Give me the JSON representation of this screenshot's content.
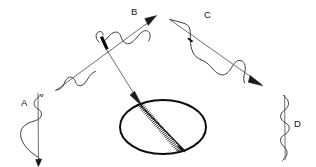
{
  "figure": {
    "title": "",
    "background_color": "#ffffff",
    "ink_color": "#111111",
    "width": 316,
    "height": 167
  },
  "labels": {
    "a": "A",
    "b": "B",
    "c": "C",
    "d": "D"
  },
  "elements": {
    "left_vertical_axis_name": "vertical-axis-left",
    "right_vertical_axis_name": "vertical-axis-right",
    "incoming_ray_name": "incoming-ray-b",
    "outgoing_ray_name": "outgoing-ray-c",
    "scatter_arrow_name": "scatter-arrow",
    "ellipse_name": "scattering-ellipse",
    "coil_name": "helical-coil"
  },
  "geometry": {
    "left_axis": {
      "x": 38,
      "y_top": 94,
      "y_bottom": 165
    },
    "right_axis": {
      "x": 285,
      "y_top": 96,
      "y_bottom": 160
    },
    "ray_b": {
      "x1": 55,
      "y1": 90,
      "x2": 155,
      "y2": 18
    },
    "ray_c": {
      "x1": 168,
      "y1": 18,
      "x2": 262,
      "y2": 85
    },
    "ellipse": {
      "cx": 163,
      "cy": 127,
      "rx": 43,
      "ry": 27
    },
    "scatter_arrow": {
      "x1": 106,
      "y1": 48,
      "x2": 140,
      "y2": 103
    },
    "coil": {
      "x1": 141,
      "y1": 105,
      "x2": 184,
      "y2": 150
    }
  }
}
